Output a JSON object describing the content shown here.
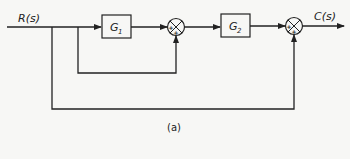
{
  "diagram": {
    "input_label": "R(s)",
    "output_label": "C(s)",
    "blocks": [
      {
        "id": "g1",
        "label": "G",
        "subscript": "1"
      },
      {
        "id": "g2",
        "label": "G",
        "subscript": "2"
      }
    ],
    "summing_junctions": [
      {
        "id": "sum1",
        "signs": {
          "left": "+",
          "bottom": "+"
        }
      },
      {
        "id": "sum2",
        "signs": {
          "left": "+",
          "bottom": "+"
        }
      }
    ],
    "caption": "(a)",
    "colors": {
      "line": "#222222",
      "background": "#f7f7f5",
      "block_fill": "#f7f7f5"
    }
  }
}
